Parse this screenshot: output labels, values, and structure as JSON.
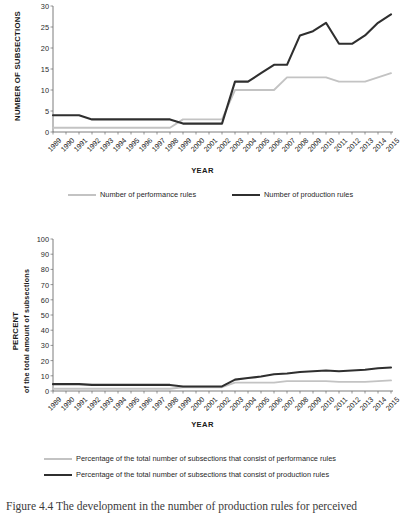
{
  "figure": {
    "caption": "Figure 4.4 The development in the number of production rules for perceived"
  },
  "top_chart": {
    "y_axis_title": "NUMBER OF SUBSECTIONS",
    "x_axis_title": "YEAR",
    "yticks": [
      0,
      5,
      10,
      15,
      20,
      25,
      30
    ],
    "legend": [
      {
        "label": "Number of performance rules",
        "style": "light",
        "color": "#c3c3c3"
      },
      {
        "label": "Number of production rules",
        "style": "dark",
        "color": "#2f2f2f"
      }
    ]
  },
  "bottom_chart": {
    "y_axis_title_main": "PERCENT",
    "y_axis_title_sub": "of the total amount of subsections",
    "x_axis_title": "YEAR",
    "yticks": [
      0,
      10,
      20,
      30,
      40,
      50,
      60,
      70,
      80,
      90,
      100
    ],
    "legend": [
      {
        "label": "Percentage of the total number of subsections that consist of performance rules",
        "style": "light",
        "color": "#c3c3c3"
      },
      {
        "label": "Percentage of the total number of subsections that consist of production rules",
        "style": "dark",
        "color": "#2f2f2f"
      }
    ]
  },
  "chart_data": [
    {
      "id": "top",
      "type": "line",
      "title": "",
      "xlabel": "YEAR",
      "ylabel": "NUMBER OF SUBSECTIONS",
      "ylim": [
        0,
        30
      ],
      "yticks": [
        0,
        5,
        10,
        15,
        20,
        25,
        30
      ],
      "grid": false,
      "legend_position": "below",
      "categories": [
        "1989",
        "1990",
        "1991",
        "1992",
        "1993",
        "1994",
        "1995",
        "1996",
        "1997",
        "1998",
        "1999",
        "2000",
        "2001",
        "2002",
        "2003",
        "2004",
        "2005",
        "2006",
        "2007",
        "2008",
        "2009",
        "2010",
        "2011",
        "2012",
        "2013",
        "2014",
        "2015"
      ],
      "series": [
        {
          "name": "Number of performance rules",
          "color": "#c3c3c3",
          "values": [
            1,
            1,
            1,
            1,
            1,
            1,
            1,
            1,
            1,
            1,
            3,
            3,
            3,
            3,
            10,
            10,
            10,
            10,
            13,
            13,
            13,
            13,
            12,
            12,
            12,
            13,
            14
          ]
        },
        {
          "name": "Number of production rules",
          "color": "#2f2f2f",
          "values": [
            4,
            4,
            4,
            3,
            3,
            3,
            3,
            3,
            3,
            3,
            2,
            2,
            2,
            2,
            12,
            12,
            14,
            16,
            16,
            23,
            24,
            26,
            21,
            21,
            23,
            26,
            28
          ]
        }
      ]
    },
    {
      "id": "bottom",
      "type": "line",
      "title": "",
      "xlabel": "YEAR",
      "ylabel": "PERCENT of the total amount of subsections",
      "ylim": [
        0,
        100
      ],
      "yticks": [
        0,
        10,
        20,
        30,
        40,
        50,
        60,
        70,
        80,
        90,
        100
      ],
      "grid": false,
      "legend_position": "below",
      "categories": [
        "1989",
        "1990",
        "1991",
        "1992",
        "1993",
        "1994",
        "1995",
        "1996",
        "1997",
        "1998",
        "1999",
        "2000",
        "2001",
        "2002",
        "2003",
        "2004",
        "2005",
        "2006",
        "2007",
        "2008",
        "2009",
        "2010",
        "2011",
        "2012",
        "2013",
        "2014",
        "2015"
      ],
      "series": [
        {
          "name": "Percentage of the total number of subsections that consist of performance rules",
          "color": "#c3c3c3",
          "values": [
            1.5,
            1.5,
            1.5,
            1.5,
            1.5,
            1.5,
            1.5,
            1.5,
            1.5,
            1.5,
            2.5,
            2.5,
            2.5,
            2.5,
            5.5,
            5.5,
            5.5,
            5.5,
            6.5,
            6.5,
            6.5,
            6.5,
            6.0,
            6.0,
            6.0,
            6.5,
            7.0
          ]
        },
        {
          "name": "Percentage of the total number of subsections that consist of production rules",
          "color": "#2f2f2f",
          "values": [
            4.5,
            4.5,
            4.5,
            4.0,
            4.0,
            4.0,
            4.0,
            4.0,
            4.0,
            4.0,
            3.0,
            3.0,
            3.0,
            3.0,
            7.5,
            8.5,
            9.5,
            11.0,
            11.5,
            12.5,
            13.0,
            13.5,
            13.0,
            13.5,
            14.0,
            15.0,
            15.5
          ]
        }
      ]
    }
  ]
}
